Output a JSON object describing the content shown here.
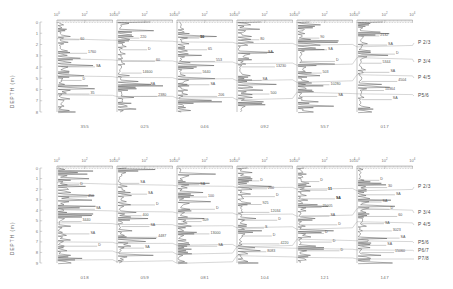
{
  "figure": {
    "kind": "borehole-geotechnical-log-correlation",
    "y_axis_label": "DEPTH (m)",
    "x_axis_note": "logarithmic scale"
  },
  "chart_data": {
    "type": "line",
    "title": "",
    "xlabel": "",
    "ylabel": "DEPTH (m)",
    "xscale": "log",
    "grid": false,
    "legend_position": "none",
    "panels": [
      {
        "id": "top",
        "ylim": [
          0,
          8
        ],
        "y_ticks": [
          "0",
          "1",
          "2",
          "3",
          "4",
          "5",
          "6",
          "7",
          "8"
        ],
        "x_ticks": [
          "10^0",
          "10^2",
          "10^4"
        ],
        "x_tick_labels": [
          "10",
          "10",
          "10"
        ],
        "x_tick_exponents": [
          "0",
          "2",
          "4"
        ],
        "boreholes": [
          {
            "name": "355",
            "annotations": [
              {
                "text": "60",
                "bold": false
              },
              {
                "text": "1760",
                "bold": false
              },
              {
                "text": "SA",
                "bold": false
              },
              {
                "text": "D",
                "bold": false
              },
              {
                "text": "35",
                "bold": false
              }
            ]
          },
          {
            "name": "025",
            "annotations": [
              {
                "text": "220",
                "bold": false
              },
              {
                "text": "D",
                "bold": false
              },
              {
                "text": "60",
                "bold": false
              },
              {
                "text": "14600",
                "bold": false
              },
              {
                "text": "SA",
                "bold": false
              },
              {
                "text": "2380",
                "bold": false
              }
            ]
          },
          {
            "name": "046",
            "annotations": [
              {
                "text": "50",
                "bold": true
              },
              {
                "text": "65",
                "bold": false
              },
              {
                "text": "553",
                "bold": false
              },
              {
                "text": "5640",
                "bold": false
              },
              {
                "text": "SA",
                "bold": false
              },
              {
                "text": "206",
                "bold": false
              }
            ]
          },
          {
            "name": "092",
            "annotations": [
              {
                "text": "80",
                "bold": false
              },
              {
                "text": "SA",
                "bold": false
              },
              {
                "text": "13230",
                "bold": false
              },
              {
                "text": "SA",
                "bold": false
              },
              {
                "text": "500",
                "bold": false
              }
            ]
          },
          {
            "name": "557",
            "annotations": [
              {
                "text": "90",
                "bold": false
              },
              {
                "text": "SA",
                "bold": false
              },
              {
                "text": "D",
                "bold": false
              },
              {
                "text": "503",
                "bold": false
              },
              {
                "text": "10280",
                "bold": false
              },
              {
                "text": "SA",
                "bold": false
              }
            ]
          },
          {
            "name": "017",
            "annotations": [
              {
                "text": "2132",
                "bold": false
              },
              {
                "text": "SA",
                "bold": false
              },
              {
                "text": "D",
                "bold": false
              },
              {
                "text": "5344",
                "bold": false
              },
              {
                "text": "SA",
                "bold": false
              },
              {
                "text": "4504",
                "bold": false
              },
              {
                "text": "10364",
                "bold": false
              },
              {
                "text": "SA",
                "bold": false
              }
            ]
          }
        ],
        "horizons": [
          "P 2/3",
          "P 3/4",
          "P 4/5",
          "P5/6"
        ]
      },
      {
        "id": "bottom",
        "ylim": [
          0,
          9
        ],
        "y_ticks": [
          "0",
          "1",
          "2",
          "3",
          "4",
          "5",
          "6",
          "7",
          "8",
          "9"
        ],
        "x_ticks": [
          "10^0",
          "10^2",
          "10^4"
        ],
        "x_tick_labels": [
          "10",
          "10",
          "10"
        ],
        "x_tick_exponents": [
          "0",
          "2",
          "4"
        ],
        "boreholes": [
          {
            "name": "018",
            "annotations": [
              {
                "text": "D",
                "bold": false
              },
              {
                "text": "450",
                "bold": false
              },
              {
                "text": "SA",
                "bold": false
              },
              {
                "text": "3440",
                "bold": false
              },
              {
                "text": "SA",
                "bold": false
              },
              {
                "text": "D",
                "bold": false
              }
            ]
          },
          {
            "name": "059",
            "annotations": [
              {
                "text": "SA",
                "bold": false
              },
              {
                "text": "SA",
                "bold": false
              },
              {
                "text": "D",
                "bold": false
              },
              {
                "text": "400",
                "bold": false
              },
              {
                "text": "SA",
                "bold": false
              },
              {
                "text": "4487",
                "bold": false
              },
              {
                "text": "SA",
                "bold": false
              }
            ]
          },
          {
            "name": "081",
            "annotations": [
              {
                "text": "SA",
                "bold": false
              },
              {
                "text": "100",
                "bold": false
              },
              {
                "text": "D",
                "bold": false
              },
              {
                "text": "509",
                "bold": false
              },
              {
                "text": "13000",
                "bold": false
              },
              {
                "text": "SA",
                "bold": false
              }
            ]
          },
          {
            "name": "104",
            "annotations": [
              {
                "text": "D",
                "bold": false
              },
              {
                "text": "200",
                "bold": false
              },
              {
                "text": "D",
                "bold": false
              },
              {
                "text": "925",
                "bold": false
              },
              {
                "text": "12034",
                "bold": false
              },
              {
                "text": "D",
                "bold": false
              },
              {
                "text": "S",
                "bold": false
              },
              {
                "text": "D",
                "bold": false
              },
              {
                "text": "4220",
                "bold": false
              },
              {
                "text": "8083",
                "bold": false
              }
            ]
          },
          {
            "name": "121",
            "annotations": [
              {
                "text": "D",
                "bold": false
              },
              {
                "text": "11",
                "bold": true
              },
              {
                "text": "SA",
                "bold": true
              },
              {
                "text": "25005",
                "bold": false
              },
              {
                "text": "SA",
                "bold": false
              },
              {
                "text": "D",
                "bold": false
              },
              {
                "text": "D",
                "bold": false
              },
              {
                "text": "D",
                "bold": false
              },
              {
                "text": "D",
                "bold": false
              }
            ]
          },
          {
            "name": "147",
            "annotations": [
              {
                "text": "D",
                "bold": false
              },
              {
                "text": "30",
                "bold": false
              },
              {
                "text": "SA",
                "bold": false
              },
              {
                "text": "SA",
                "bold": false
              },
              {
                "text": "D",
                "bold": false
              },
              {
                "text": "60",
                "bold": false
              },
              {
                "text": "SA",
                "bold": false
              },
              {
                "text": "3023",
                "bold": false
              },
              {
                "text": "SA",
                "bold": false
              },
              {
                "text": "SA",
                "bold": false
              },
              {
                "text": "15060",
                "bold": false
              }
            ]
          }
        ],
        "horizons": [
          "P 2/3",
          "P 3/4",
          "P 4/5",
          "P5/6",
          "P6/7",
          "P7/8"
        ]
      }
    ]
  },
  "colors": {
    "trace": "#4d4d4d",
    "correlation": "#9a9a9a",
    "axis": "#8a8a8a",
    "text": "#555555",
    "emphasis": "#2b2b2b"
  }
}
